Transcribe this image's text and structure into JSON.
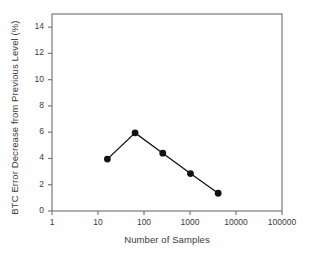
{
  "chart_data": {
    "type": "line",
    "title": "",
    "subtitle": "",
    "xlabel": "Number of Samples",
    "ylabel": "BTC Error Decrease from Previous Level (%)",
    "xscale": "log",
    "yscale": "linear",
    "xlim": [
      1,
      100000
    ],
    "ylim": [
      0,
      15
    ],
    "grid": false,
    "legend": null,
    "xticks": [
      1,
      10,
      100,
      1000,
      10000,
      100000
    ],
    "xtick_labels": [
      "1",
      "10",
      "100",
      "1000",
      "10000",
      "100000"
    ],
    "yticks": [
      0,
      2,
      4,
      6,
      8,
      10,
      12,
      14
    ],
    "ytick_labels": [
      "0",
      "2",
      "4",
      "6",
      "8",
      "10",
      "12",
      "14"
    ],
    "marker": "filled-circle",
    "marker_color": "#111111",
    "line_color": "#111111",
    "x": [
      16,
      64,
      256,
      1024,
      4096
    ],
    "values": [
      3.95,
      5.95,
      4.4,
      2.85,
      1.35
    ],
    "points": [
      {
        "x": 16,
        "y": 3.95
      },
      {
        "x": 64,
        "y": 5.95
      },
      {
        "x": 256,
        "y": 4.4
      },
      {
        "x": 1024,
        "y": 2.85
      },
      {
        "x": 4096,
        "y": 1.35
      }
    ],
    "frame": "box",
    "frame_color": "#7a7a7a",
    "background": "#ffffff"
  },
  "axes": {
    "y_title": "BTC Error Decrease from Previous Level (%)",
    "x_title": "Number of Samples"
  },
  "ytick_labels": [
    "14",
    "12",
    "10",
    "8",
    "6",
    "4",
    "2",
    "0"
  ],
  "xtick_labels": [
    "1",
    "10",
    "100",
    "1000",
    "10000",
    "100000"
  ]
}
